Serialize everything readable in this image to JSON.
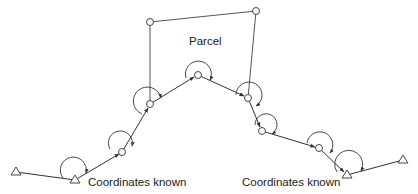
{
  "diagram": {
    "type": "survey-traverse",
    "labels": {
      "parcel": "Parcel",
      "known_left": "Coordinates known",
      "known_right": "Coordinates known"
    },
    "known_points": [
      {
        "id": "T1",
        "shape": "triangle",
        "x": 16,
        "y": 172
      },
      {
        "id": "T2",
        "shape": "triangle",
        "x": 75,
        "y": 180
      },
      {
        "id": "T3",
        "shape": "triangle",
        "x": 347,
        "y": 175
      },
      {
        "id": "T4",
        "shape": "triangle",
        "x": 403,
        "y": 160
      }
    ],
    "traverse_points": [
      {
        "id": "C1",
        "x": 122,
        "y": 152
      },
      {
        "id": "C2",
        "x": 150,
        "y": 104
      },
      {
        "id": "C3",
        "x": 198,
        "y": 75
      },
      {
        "id": "C4",
        "x": 248,
        "y": 98
      },
      {
        "id": "C5",
        "x": 262,
        "y": 131
      },
      {
        "id": "C6",
        "x": 319,
        "y": 148
      }
    ],
    "parcel_corners": [
      {
        "id": "P1",
        "x": 150,
        "y": 22
      },
      {
        "id": "P2",
        "x": 256,
        "y": 11
      }
    ],
    "colors": {
      "line": "#333333",
      "text": "#222222",
      "background": "#ffffff"
    }
  }
}
